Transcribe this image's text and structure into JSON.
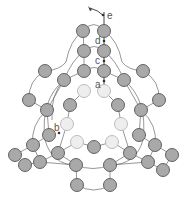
{
  "diagram": {
    "labels": {
      "a": "a",
      "b": "b",
      "c": "c",
      "d": "d",
      "e": "e"
    },
    "colors": {
      "node_dark": "#a9a9a9",
      "node_light": "#eeeeee",
      "edge": "#6a6a6a"
    }
  }
}
